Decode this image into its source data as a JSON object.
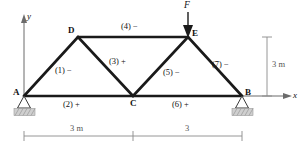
{
  "figure": {
    "nodes": [
      {
        "id": "A",
        "label": "A",
        "x": 24,
        "y": 96
      },
      {
        "id": "B",
        "label": "B",
        "x": 242,
        "y": 96
      },
      {
        "id": "C",
        "label": "C",
        "x": 133,
        "y": 96
      },
      {
        "id": "D",
        "label": "D",
        "x": 78,
        "y": 37
      },
      {
        "id": "E",
        "label": "E",
        "x": 188,
        "y": 37
      }
    ],
    "members": [
      {
        "id": "1",
        "label": "(1) −",
        "from": "A",
        "to": "D",
        "sign": "-"
      },
      {
        "id": "2",
        "label": "(2) +",
        "from": "A",
        "to": "C",
        "sign": "+"
      },
      {
        "id": "3",
        "label": "(3) +",
        "from": "D",
        "to": "C",
        "sign": "+"
      },
      {
        "id": "4",
        "label": "(4) −",
        "from": "D",
        "to": "E",
        "sign": "-"
      },
      {
        "id": "5",
        "label": "(5) −",
        "from": "C",
        "to": "E",
        "sign": "-"
      },
      {
        "id": "6",
        "label": "(6) +",
        "from": "C",
        "to": "B",
        "sign": "+"
      },
      {
        "id": "7",
        "label": "(7) −",
        "from": "E",
        "to": "B",
        "sign": "-"
      }
    ],
    "load": {
      "label": "F",
      "applied_at": "E",
      "direction": "down"
    },
    "axes": {
      "y_label": "y",
      "x_label": "x"
    },
    "supports": [
      {
        "at": "A",
        "type": "pin-hatched"
      },
      {
        "at": "B",
        "type": "pin-hatched"
      }
    ],
    "dimensions": {
      "horizontal": [
        {
          "label": "3 m",
          "span": "A-C"
        },
        {
          "label": "3",
          "span": "C-B"
        }
      ],
      "vertical": [
        {
          "label": "3 m",
          "span": "height"
        }
      ]
    },
    "colors": {
      "member": "#1a1a1a",
      "axis": "#6b6b6b",
      "dimension": "#8a8a8a",
      "hatch": "#b9b9b9",
      "text": "#111111"
    }
  }
}
